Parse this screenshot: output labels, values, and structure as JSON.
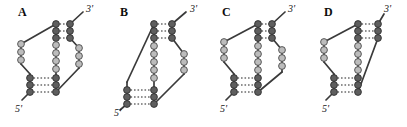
{
  "figure": {
    "caption": "",
    "background_color": "#ffffff",
    "width": 407,
    "height": 127,
    "panel_count": 4
  },
  "legend": {
    "paired_node_color": "#595959",
    "unpaired_node_color": "#b5b5b5",
    "node_stroke_color": "#333333",
    "backbone_color": "#3a3a3a",
    "basepair_color": "#6e6e6e",
    "paired_node_name": "paired-nucleotide",
    "unpaired_node_name": "unpaired-nucleotide",
    "backbone_name": "backbone-strand",
    "basepair_name": "base-pair-bond"
  },
  "labels": {
    "five_prime": "5'",
    "three_prime": "3'"
  },
  "panels": [
    {
      "id": "A",
      "letter": "A",
      "letter_x": 18,
      "letter_y": 6,
      "five_prime_x": 15,
      "five_prime_y": 104,
      "three_prime_x": 86,
      "three_prime_y": 4,
      "origin_x": 0,
      "stem1_pairs": 3,
      "stem2_pairs": 3,
      "loop1_nodes": 3,
      "loop2_nodes": 5,
      "loop3_nodes": 3,
      "type": "pseudoknot-h-type"
    },
    {
      "id": "B",
      "letter": "B",
      "letter_x": 120,
      "letter_y": 6,
      "five_prime_x": 114,
      "five_prime_y": 108,
      "three_prime_x": 190,
      "three_prime_y": 4,
      "origin_x": 100,
      "stem1_pairs": 3,
      "stem2_pairs": 3,
      "loop1_nodes": 3,
      "loop2_nodes": 5,
      "loop3_nodes": 3,
      "type": "pseudoknot-h-type"
    },
    {
      "id": "C",
      "letter": "C",
      "letter_x": 222,
      "letter_y": 6,
      "five_prime_x": 220,
      "five_prime_y": 104,
      "three_prime_x": 288,
      "three_prime_y": 4,
      "origin_x": 202,
      "stem1_pairs": 3,
      "stem2_pairs": 3,
      "loop1_nodes": 3,
      "loop2_nodes": 5,
      "loop3_nodes": 3,
      "type": "pseudoknot-h-type"
    },
    {
      "id": "D",
      "letter": "D",
      "letter_x": 324,
      "letter_y": 6,
      "five_prime_x": 322,
      "five_prime_y": 104,
      "three_prime_x": 384,
      "three_prime_y": 4,
      "origin_x": 304,
      "stem1_pairs": 3,
      "stem2_pairs": 3,
      "loop1_nodes": 3,
      "loop2_nodes": 5,
      "loop3_nodes": 3,
      "type": "pseudoknot-h-type"
    }
  ]
}
